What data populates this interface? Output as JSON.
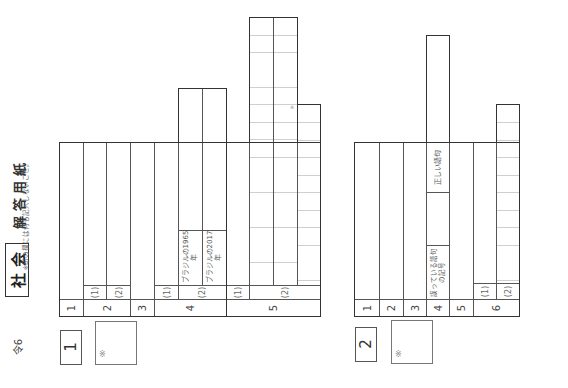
{
  "header": {
    "era": "令6",
    "subject": "社 会",
    "title": "解 答 用 紙",
    "note": "※印の欄には何も記入しないこと。"
  },
  "sections": [
    {
      "number": "1",
      "mark": "※",
      "questions": [
        {
          "label": "1"
        },
        {
          "label": "2",
          "parts": [
            "(1)",
            "(2)"
          ]
        },
        {
          "label": "3"
        },
        {
          "label": "4",
          "parts": [
            "(1)",
            "(2)"
          ],
          "sublabels": [
            "ブラジルの1965年",
            "ブラジルの2017年"
          ]
        },
        {
          "label": "5",
          "parts": [
            "(1)",
            "(2)"
          ],
          "grid_note": "※"
        }
      ]
    },
    {
      "number": "2",
      "mark": "※",
      "questions": [
        {
          "label": "1"
        },
        {
          "label": "2"
        },
        {
          "label": "3"
        },
        {
          "label": "4",
          "sublabels": [
            "誤っている語句の記号",
            "正しい語句"
          ]
        },
        {
          "label": "5"
        },
        {
          "label": "6",
          "parts": [
            "(1)",
            "(2)"
          ]
        }
      ]
    }
  ]
}
